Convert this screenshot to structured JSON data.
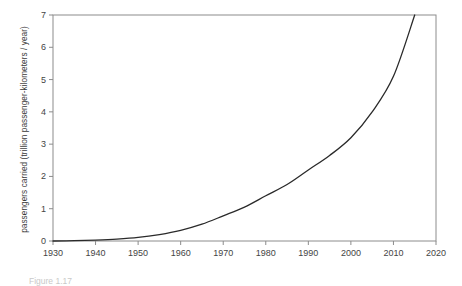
{
  "chart_data": {
    "type": "line",
    "title": "",
    "xlabel": "",
    "ylabel": "passengers carried (trillion passenger-kilometers / year)",
    "xlim": [
      1930,
      2020
    ],
    "ylim": [
      0,
      7
    ],
    "grid": false,
    "legend": null,
    "xticks": [
      "1930",
      "1940",
      "1950",
      "1960",
      "1970",
      "1980",
      "1990",
      "2000",
      "2010",
      "2020"
    ],
    "yticks": [
      "0",
      "1",
      "2",
      "3",
      "4",
      "5",
      "6",
      "7"
    ],
    "series": [
      {
        "name": "passengers carried",
        "x": [
          1930,
          1935,
          1940,
          1945,
          1950,
          1955,
          1960,
          1965,
          1970,
          1975,
          1980,
          1985,
          1990,
          1995,
          2000,
          2005,
          2010,
          2015
        ],
        "values": [
          0.0,
          0.01,
          0.03,
          0.06,
          0.11,
          0.2,
          0.33,
          0.52,
          0.78,
          1.05,
          1.4,
          1.75,
          2.2,
          2.65,
          3.2,
          4.0,
          5.1,
          7.0
        ]
      }
    ],
    "line_color": "#2a2a2a",
    "axis_color": "#8c8c8c"
  },
  "caption": {
    "text": "Figure 1.17"
  },
  "axis_titles": {
    "y": "passengers carried (trillion passenger-kilometers / year)"
  }
}
